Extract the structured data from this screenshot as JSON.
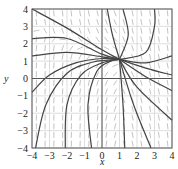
{
  "chart_data": {
    "type": "line",
    "subtype": "slope-field",
    "title": "",
    "xlabel": "x",
    "ylabel": "y",
    "xlim": [
      -4,
      4
    ],
    "ylim": [
      -4,
      4
    ],
    "xticks": [
      -4,
      -3,
      -2,
      -1,
      0,
      1,
      2,
      3,
      4
    ],
    "yticks": [
      -4,
      -3,
      -2,
      -1,
      0,
      1,
      2,
      3,
      4
    ],
    "xtick_labels": [
      "−4",
      "−3",
      "−2",
      "−1",
      "0",
      "1",
      "2",
      "3",
      "4"
    ],
    "ytick_labels": [
      "−4",
      "−3",
      "−2",
      "−1",
      "0",
      "1",
      "2",
      "3",
      "4"
    ],
    "grid": true,
    "legend": null,
    "convergence_point": [
      1,
      1.1
    ],
    "series": [
      {
        "name": "solution-1",
        "points": [
          [
            -4,
            4
          ],
          [
            -2,
            2.9
          ],
          [
            0,
            1.65
          ],
          [
            1,
            1.1
          ]
        ]
      },
      {
        "name": "solution-2",
        "points": [
          [
            -4,
            2.3
          ],
          [
            -2,
            2.3
          ],
          [
            0,
            1.4
          ],
          [
            1,
            1.1
          ]
        ]
      },
      {
        "name": "solution-3",
        "points": [
          [
            -4,
            1.3
          ],
          [
            -2,
            1.5
          ],
          [
            0,
            1.25
          ],
          [
            1,
            1.1
          ]
        ]
      },
      {
        "name": "solution-4",
        "points": [
          [
            -4,
            -0.8
          ],
          [
            -3,
            0.2
          ],
          [
            -1.5,
            0.9
          ],
          [
            0,
            1.15
          ],
          [
            1,
            1.1
          ]
        ]
      },
      {
        "name": "solution-5",
        "points": [
          [
            -3.8,
            -4
          ],
          [
            -3.2,
            -1.5
          ],
          [
            -2,
            0.3
          ],
          [
            -0.5,
            0.95
          ],
          [
            1,
            1.1
          ]
        ]
      },
      {
        "name": "solution-6",
        "points": [
          [
            -2.1,
            -4
          ],
          [
            -2,
            -1.5
          ],
          [
            -1.2,
            0.2
          ],
          [
            0,
            0.9
          ],
          [
            1,
            1.1
          ]
        ]
      },
      {
        "name": "solution-7",
        "points": [
          [
            -0.6,
            -4
          ],
          [
            -0.8,
            -1.5
          ],
          [
            -0.3,
            0.4
          ],
          [
            0.5,
            1.0
          ],
          [
            1,
            1.1
          ]
        ]
      },
      {
        "name": "solution-8",
        "points": [
          [
            1,
            1.1
          ],
          [
            0.6,
            2.5
          ],
          [
            0.3,
            4
          ]
        ]
      },
      {
        "name": "solution-9",
        "points": [
          [
            1,
            1.1
          ],
          [
            1.5,
            2.5
          ],
          [
            1.2,
            4
          ]
        ]
      },
      {
        "name": "solution-10",
        "points": [
          [
            1,
            1.1
          ],
          [
            2.5,
            1.5
          ],
          [
            3,
            3
          ],
          [
            3,
            4
          ]
        ]
      },
      {
        "name": "solution-11",
        "points": [
          [
            1,
            1.1
          ],
          [
            2.5,
            0.9
          ],
          [
            4,
            1.3
          ]
        ]
      },
      {
        "name": "solution-12",
        "points": [
          [
            1,
            1.1
          ],
          [
            2.5,
            0.6
          ],
          [
            4,
            0.2
          ]
        ]
      },
      {
        "name": "solution-13",
        "points": [
          [
            1,
            1.1
          ],
          [
            2.5,
            0.1
          ],
          [
            4,
            -0.7
          ]
        ]
      },
      {
        "name": "solution-14",
        "points": [
          [
            1,
            1.1
          ],
          [
            2,
            -0.5
          ],
          [
            4,
            -2.4
          ]
        ]
      },
      {
        "name": "solution-15",
        "points": [
          [
            1,
            1.1
          ],
          [
            1.8,
            -1.5
          ],
          [
            2.8,
            -4
          ]
        ]
      },
      {
        "name": "solution-16",
        "points": [
          [
            1,
            1.1
          ],
          [
            1.2,
            -1.5
          ],
          [
            1.3,
            -4
          ]
        ]
      }
    ],
    "slope_field": {
      "description": "short dashes on a grid; near-horizontal around y≈2 on the left, steep positive in lower-left, steep negative in upper-right and lower-right",
      "grid_spacing": 0.5
    }
  }
}
